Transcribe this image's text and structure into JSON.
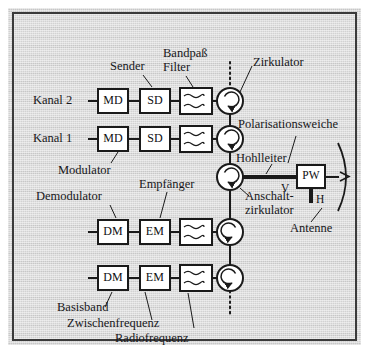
{
  "figure": {
    "title_implicit": "Blockschaltbild Sende-/Empfangszweig mit Zirkulatoren und Polarisationsweiche",
    "background_color": "#d2d2d2",
    "line_color": "#1a1a1a"
  },
  "channels": {
    "tx": [
      {
        "id": "kanal2",
        "label": "Kanal 2",
        "blocks": [
          {
            "name": "MD",
            "role": "modulator"
          },
          {
            "name": "SD",
            "role": "sender"
          },
          {
            "name": "",
            "role": "bandpass-filter"
          }
        ]
      },
      {
        "id": "kanal1",
        "label": "Kanal 1",
        "blocks": [
          {
            "name": "MD",
            "role": "modulator"
          },
          {
            "name": "SD",
            "role": "sender"
          },
          {
            "name": "",
            "role": "bandpass-filter"
          }
        ]
      }
    ],
    "rx": [
      {
        "id": "rx1",
        "label": "",
        "blocks": [
          {
            "name": "DM",
            "role": "demodulator"
          },
          {
            "name": "EM",
            "role": "empfaenger"
          },
          {
            "name": "",
            "role": "bandpass-filter"
          }
        ]
      },
      {
        "id": "rx2",
        "label": "",
        "blocks": [
          {
            "name": "DM",
            "role": "demodulator"
          },
          {
            "name": "EM",
            "role": "empfaenger"
          },
          {
            "name": "",
            "role": "bandpass-filter"
          }
        ]
      }
    ]
  },
  "annotations": {
    "sender": "Sender",
    "bandpass_line1": "Bandpaß",
    "bandpass_line2": "Filter",
    "zirkulator": "Zirkulator",
    "polarisationsweiche": "Polarisationsweiche",
    "hohlleiter": "Hohlleiter",
    "modulator": "Modulator",
    "demodulator": "Demodulator",
    "empfaenger": "Empfänger",
    "anschalt_line1": "Anschalt-",
    "anschalt_line2": "zirkulator",
    "antenne": "Antenne",
    "basisband": "Basisband",
    "zwischenfrequenz": "Zwischenfrequenz",
    "radiofrequenz": "Radiofrequenz"
  },
  "polarisation": {
    "box_label": "PW",
    "vertical_port": "V",
    "horizontal_port": "H"
  },
  "block_labels": {
    "md": "MD",
    "sd": "SD",
    "dm": "DM",
    "em": "EM"
  }
}
